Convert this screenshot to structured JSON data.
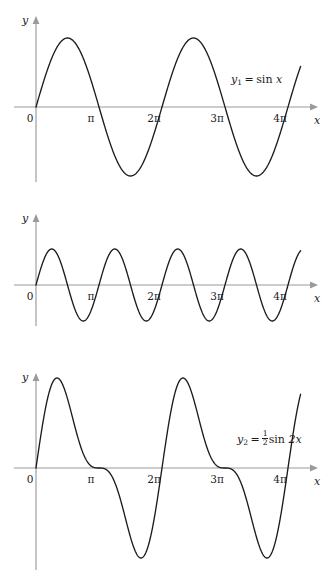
{
  "figure": {
    "background": "#ffffff",
    "curve_color": "#1c1c1c",
    "axis_color": "#9a9a9a",
    "text_color": "#1c1c1c"
  },
  "panels": [
    {
      "id": "panel-0",
      "y_axis_label": "y",
      "x_axis_label": "x",
      "origin_label": "0",
      "tick_labels": [
        "π",
        "2π",
        "3π",
        "4π"
      ],
      "equation": {
        "lhs": "y",
        "lhs_sub": "1",
        "equals": "=",
        "rhs_prefix": "",
        "rhs_func": "sin",
        "rhs_arg": "x"
      },
      "equation_plain": "y₁ = sin x"
    },
    {
      "id": "panel-1",
      "y_axis_label": "y",
      "x_axis_label": "x",
      "origin_label": "0",
      "tick_labels": [
        "π",
        "2π",
        "3π",
        "4π"
      ],
      "equation": {
        "lhs": "y",
        "lhs_sub": "2",
        "equals": "=",
        "frac_num": "1",
        "frac_den": "2",
        "rhs_func": "sin",
        "rhs_arg": "2x"
      },
      "equation_plain": "y₂ = ½sin 2x"
    },
    {
      "id": "panel-2",
      "y_axis_label": "y",
      "x_axis_label": "x",
      "origin_label": "0",
      "tick_labels": [
        "π",
        "2π",
        "3π",
        "4π"
      ],
      "equation": {
        "lhs": "y",
        "equals": "=",
        "term1": "y",
        "term1_sub": "1",
        "plus": "+",
        "term2": "y",
        "term2_sub": "2"
      },
      "equation_plain": "y = y₁ + y₂"
    }
  ],
  "chart_data": [
    {
      "type": "line",
      "title": "y₁ = sin x",
      "xlabel": "x",
      "ylabel": "y",
      "xlim": [
        0,
        13.195
      ],
      "ylim": [
        -1.15,
        1.15
      ],
      "xtick_values": [
        0,
        3.14159,
        6.28319,
        9.42478,
        12.56637
      ],
      "xtick_labels": [
        "0",
        "π",
        "2π",
        "3π",
        "4π"
      ],
      "grid": false,
      "legend": "none",
      "series": [
        {
          "name": "y1",
          "formula": "sin(x)",
          "amplitude": 1,
          "frequency": 1,
          "phase": 0,
          "maxima_x": [
            1.5708,
            7.85398
          ],
          "maxima_y": [
            1,
            1
          ],
          "minima_x": [
            4.71239,
            10.99557
          ],
          "minima_y": [
            -1,
            -1
          ],
          "zeros_x": [
            0,
            3.14159,
            6.28319,
            9.42478,
            12.56637
          ]
        }
      ]
    },
    {
      "type": "line",
      "title": "y₂ = ½sin 2x",
      "xlabel": "x",
      "ylabel": "y",
      "xlim": [
        0,
        13.195
      ],
      "ylim": [
        -0.62,
        0.62
      ],
      "xtick_values": [
        0,
        3.14159,
        6.28319,
        9.42478,
        12.56637
      ],
      "xtick_labels": [
        "0",
        "π",
        "2π",
        "3π",
        "4π"
      ],
      "grid": false,
      "legend": "none",
      "series": [
        {
          "name": "y2",
          "formula": "0.5*sin(2x)",
          "amplitude": 0.5,
          "frequency": 2,
          "phase": 0,
          "maxima_x": [
            0.7854,
            3.92699,
            7.06858,
            10.21018
          ],
          "maxima_y": [
            0.5,
            0.5,
            0.5,
            0.5
          ],
          "minima_x": [
            2.35619,
            5.49779,
            8.63938,
            11.78097
          ],
          "minima_y": [
            -0.5,
            -0.5,
            -0.5,
            -0.5
          ],
          "zeros_x": [
            0,
            1.5708,
            3.14159,
            4.71239,
            6.28319,
            7.85398,
            9.42478,
            10.99557,
            12.56637
          ]
        }
      ]
    },
    {
      "type": "line",
      "title": "y = y₁ + y₂",
      "xlabel": "x",
      "ylabel": "y",
      "xlim": [
        0,
        13.195
      ],
      "ylim": [
        -1.45,
        1.45
      ],
      "xtick_values": [
        0,
        3.14159,
        6.28319,
        9.42478,
        12.56637
      ],
      "xtick_labels": [
        "0",
        "π",
        "2π",
        "3π",
        "4π"
      ],
      "grid": false,
      "legend": "none",
      "series": [
        {
          "name": "y",
          "formula": "sin(x) + 0.5*sin(2x)",
          "maxima_x": [
            1.231,
            7.5146
          ],
          "maxima_y": [
            1.299,
            1.299
          ],
          "minima_x": [
            5.0522,
            11.3358
          ],
          "minima_y": [
            -1.299,
            -1.299
          ],
          "zeros_x": [
            0,
            3.14159,
            6.28319,
            9.42478,
            12.56637
          ],
          "note": "flat inflection near π and 3π"
        }
      ]
    }
  ]
}
